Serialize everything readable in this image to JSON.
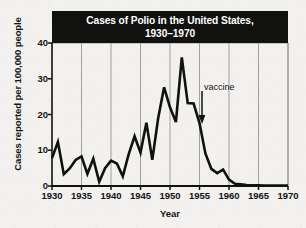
{
  "chart_data": {
    "type": "line",
    "title": "Cases of Polio in the United States, 1930–1970",
    "title_line1": "Cases of Polio in the United States,",
    "title_line2": "1930–1970",
    "xlabel": "Year",
    "ylabel": "Cases reported per 100,000 people",
    "xlim": [
      1930,
      1970
    ],
    "ylim": [
      0,
      40
    ],
    "grid": "vertical",
    "legend": "none",
    "xticks": [
      1930,
      1935,
      1940,
      1945,
      1950,
      1955,
      1960,
      1965,
      1970
    ],
    "yticks": [
      0,
      10,
      20,
      30,
      40
    ],
    "annotations": [
      {
        "text": "vaccine",
        "x": 1955.5,
        "y": 26,
        "arrow": "down",
        "arrow_from_y": 25,
        "arrow_to_y": 17
      }
    ],
    "series": [
      {
        "name": "Polio cases per 100,000",
        "color": "#111110",
        "x": [
          1930,
          1931,
          1932,
          1933,
          1934,
          1935,
          1936,
          1937,
          1938,
          1939,
          1940,
          1941,
          1942,
          1943,
          1944,
          1945,
          1946,
          1947,
          1948,
          1949,
          1950,
          1951,
          1952,
          1953,
          1954,
          1955,
          1956,
          1957,
          1958,
          1959,
          1960,
          1961,
          1962,
          1963,
          1964,
          1965,
          1966,
          1967,
          1968,
          1969,
          1970
        ],
        "values": [
          7.8,
          12.3,
          3.3,
          4.9,
          7.3,
          8.3,
          3.4,
          7.6,
          1.2,
          5.0,
          7.1,
          6.3,
          2.7,
          8.9,
          13.9,
          9.3,
          17.7,
          7.3,
          19.0,
          27.6,
          22.0,
          17.9,
          36.0,
          23.2,
          23.1,
          17.6,
          9.1,
          4.8,
          3.6,
          4.6,
          1.8,
          0.6,
          0.5,
          0.3,
          0.2,
          0.2,
          0.1,
          0.1,
          0.1,
          0.1,
          0.1
        ]
      }
    ]
  }
}
